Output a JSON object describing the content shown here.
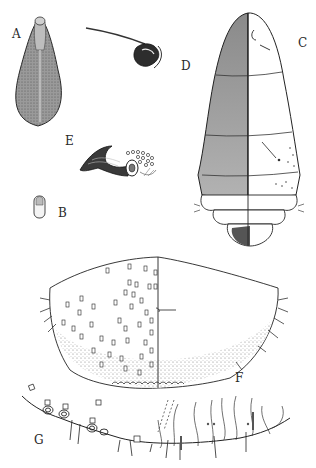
{
  "figure": {
    "type": "scientific-illustration-plate",
    "panels": [
      {
        "id": "A",
        "label": "A",
        "description": "ovoid egg-shaped body, stippled"
      },
      {
        "id": "B",
        "label": "B",
        "description": "small oblong capsule"
      },
      {
        "id": "C",
        "label": "C",
        "description": "segmented larva, right half outline view"
      },
      {
        "id": "D",
        "label": "D",
        "description": "single seta with bulbous base"
      },
      {
        "id": "E",
        "label": "E",
        "description": "trumpet-shaped seta with sockets"
      },
      {
        "id": "F",
        "label": "F",
        "description": "posterior plate with clavate setae"
      },
      {
        "id": "G",
        "label": "G",
        "description": "margin with setae and fringe"
      }
    ],
    "colors": {
      "ink": "#1e1e1e",
      "stipple_dark": "#6b6b6b",
      "stipple_light": "#c8c8c8",
      "paper": "#ffffff"
    }
  }
}
